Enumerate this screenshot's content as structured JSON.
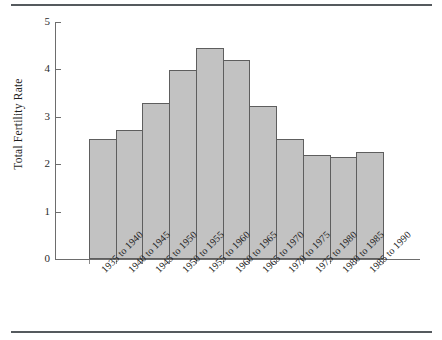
{
  "chart_data": {
    "type": "bar",
    "title": "",
    "subtitle": "",
    "xlabel": "",
    "ylabel": "Total Fertility Rate",
    "ylim": [
      0,
      5
    ],
    "yticks": [
      0,
      1,
      2,
      3,
      4,
      5
    ],
    "ytick_labels": [
      "0",
      "1",
      "2",
      "3",
      "4",
      "5"
    ],
    "grid": false,
    "legend": null,
    "categories": [
      "1935 to 1940",
      "1940 to 1945",
      "1945 to 1950",
      "1950 to 1955",
      "1955 to 1960",
      "1960 to 1965",
      "1965 to 1970",
      "1970 to 1975",
      "1975 to 1980",
      "1980 to 1985",
      "1985 to 1990"
    ],
    "values": [
      2.53,
      2.72,
      3.29,
      3.98,
      4.45,
      4.19,
      3.22,
      2.53,
      2.19,
      2.15,
      2.26
    ],
    "bar_fill_color": "#c2c2c2",
    "bar_edge_color": "#5e5e5e",
    "axis_color": "#6d6d6d",
    "text_color": "#1d1d1d",
    "background_color": "#ffffff",
    "rule_color": "#555a5e"
  },
  "figure": {
    "top_rule": "",
    "bottom_rule": ""
  }
}
